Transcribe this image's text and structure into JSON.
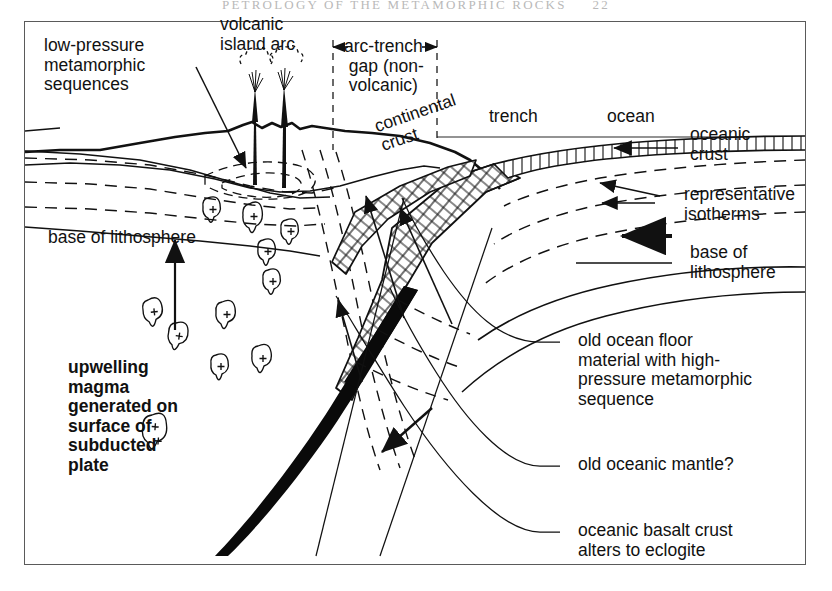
{
  "page": {
    "running_head": "PETROLOGY  OF  THE  METAMORPHIC  ROCKS",
    "page_number": "22",
    "ink": "#111111",
    "frame_color": "#5a5a5a",
    "background": "#ffffff"
  },
  "labels": {
    "low_pressure": "low-pressure\nmetamorphic\nsequences",
    "volcanic_island_arc": "volcanic\nisland arc",
    "arc_trench_gap": "arc-trench\n gap (non-\n volcanic)",
    "continental_crust": "continental\ncrust",
    "trench": "trench",
    "ocean": "ocean",
    "oceanic_crust": "oceanic\ncrust",
    "representative_isotherms": "representative\nisotherms",
    "base_of_lithosphere_right": "base of\nlithosphere",
    "base_of_lithosphere_left": "base of lithosphere",
    "upwelling_magma": "upwelling\nmagma\ngenerated on\nsurface of\nsubducted\nplate",
    "old_ocean_floor": "old ocean floor\nmaterial with high-\npressure metamorphic\nsequence",
    "old_oceanic_mantle": "old oceanic mantle?",
    "oceanic_basalt_crust": "oceanic basalt crust\nalters to eclogite"
  },
  "icons": {
    "arrow_left_head": "left-arrowhead-icon",
    "arrow_right_head": "right-arrowhead-icon",
    "arrow_up": "up-arrow-icon",
    "volcano_plume": "volcano-plume-icon",
    "magma_blob": "magma-blob-icon"
  },
  "diagram": {
    "type": "geologic-cross-section",
    "magma_blob_count": 11,
    "isotherm_style": "dashed",
    "slab_pattern": "cross-hatched grid",
    "eclogite_wedge": "solid black tapering wedge"
  }
}
